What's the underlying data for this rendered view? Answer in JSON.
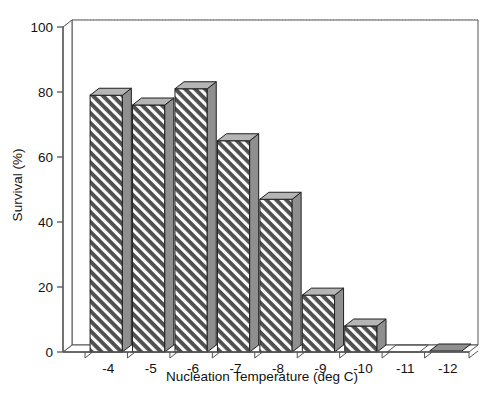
{
  "chart_data": {
    "type": "bar",
    "title": "",
    "subtitle": "",
    "xlabel": "Nucleation Temperature (deg C)",
    "ylabel": "Survival (%)",
    "categories": [
      "-4",
      "-5",
      "-6",
      "-7",
      "-8",
      "-9",
      "-10",
      "-11",
      "-12"
    ],
    "values": [
      79,
      76,
      81,
      65,
      47,
      17.5,
      8,
      0,
      0.5
    ],
    "series": [
      {
        "name": "Survival",
        "values": [
          79,
          76,
          81,
          65,
          47,
          17.5,
          8,
          0,
          0.5
        ]
      }
    ],
    "ylim": [
      0,
      100
    ],
    "yticks": [
      0,
      20,
      40,
      60,
      80,
      100
    ],
    "ytick_labels": [
      "0",
      "20",
      "40",
      "60",
      "80",
      "100"
    ],
    "xtick_labels": [
      "-4",
      "-5",
      "-6",
      "-7",
      "-8",
      "-9",
      "-10",
      "-11",
      "-12"
    ],
    "grid": true,
    "grid_axis": "y",
    "grid_style": "dotted",
    "legend": false,
    "legend_position": "none",
    "style": "3d-extruded-bars",
    "bar_fill": "diagonal-hatch",
    "annotations": []
  },
  "figure": {
    "background_color": "#ffffff",
    "axis_color": "#555555",
    "grid_color": "#999999",
    "bar_front_color": "#4a4a4a",
    "bar_hatch_color": "#ffffff",
    "bar_side_color": "#8f8f8f",
    "bar_top_color": "#b5b5b5",
    "text_color": "#121212"
  }
}
